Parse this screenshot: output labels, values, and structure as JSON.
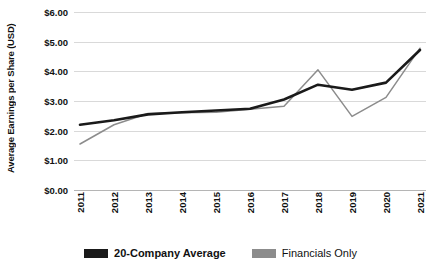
{
  "chart_data": {
    "type": "line",
    "title": "",
    "xlabel": "",
    "ylabel": "Average Earnings per Share (USD)",
    "categories": [
      "2011",
      "2012",
      "2013",
      "2014",
      "2015",
      "2016",
      "2017",
      "2018",
      "2019",
      "2020",
      "2021"
    ],
    "ytick_labels": [
      "$6.00",
      "$5.00",
      "$4.00",
      "$3.00",
      "$2.00",
      "$1.00",
      "$0.00"
    ],
    "ytick_values": [
      6,
      5,
      4,
      3,
      2,
      1,
      0
    ],
    "ylim": [
      0,
      6
    ],
    "grid": true,
    "legend_position": "bottom",
    "series": [
      {
        "name": "20-Company Average",
        "color": "#1a1a1a",
        "values": [
          2.2,
          2.35,
          2.55,
          2.62,
          2.68,
          2.74,
          3.05,
          3.55,
          3.38,
          3.62,
          4.72
        ]
      },
      {
        "name": "Financials Only",
        "color": "#8c8c8c",
        "values": [
          1.55,
          2.2,
          2.58,
          2.6,
          2.62,
          2.72,
          2.82,
          4.05,
          2.48,
          3.12,
          4.78
        ]
      }
    ]
  },
  "legend": {
    "items": [
      {
        "label": "20-Company Average",
        "color": "#1a1a1a",
        "bold": true
      },
      {
        "label": "Financials Only",
        "color": "#8c8c8c",
        "bold": false
      }
    ]
  }
}
